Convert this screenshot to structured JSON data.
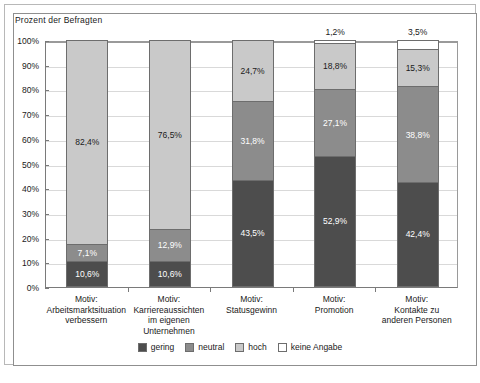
{
  "chart_data": {
    "type": "bar",
    "subtype": "stacked-percentage",
    "title": "Prozent der Befragten",
    "xlabel": "",
    "ylabel": "Prozent der Befragten",
    "ylim": [
      0,
      100
    ],
    "ytick_labels": [
      "100%",
      "90%",
      "80%",
      "70%",
      "60%",
      "50%",
      "40%",
      "30%",
      "20%",
      "10%",
      "0%"
    ],
    "ytick_values": [
      100,
      90,
      80,
      70,
      60,
      50,
      40,
      30,
      20,
      10,
      0
    ],
    "grid": true,
    "legend_position": "bottom",
    "categories": [
      [
        "Motiv:",
        "Arbeitsmarktsituation",
        "verbessern"
      ],
      [
        "Motiv:",
        "Karriereaussichten",
        "im eigenen",
        "Unternehmen"
      ],
      [
        "Motiv:",
        "Statusgewinn"
      ],
      [
        "Motiv:",
        "Promotion"
      ],
      [
        "Motiv:",
        "Kontakte zu",
        "anderen Personen"
      ]
    ],
    "series": [
      {
        "name": "gering",
        "color": "#4d4d4d",
        "values": [
          10.6,
          10.6,
          43.5,
          52.9,
          42.4
        ],
        "labels": [
          "10,6%",
          "10,6%",
          "43,5%",
          "52,9%",
          "42,4%"
        ]
      },
      {
        "name": "neutral",
        "color": "#8c8c8c",
        "values": [
          7.1,
          12.9,
          31.8,
          27.1,
          38.8
        ],
        "labels": [
          "7,1%",
          "12,9%",
          "31,8%",
          "27,1%",
          "38,8%"
        ]
      },
      {
        "name": "hoch",
        "color": "#c9c9c9",
        "values": [
          82.4,
          76.5,
          24.7,
          18.8,
          15.3
        ],
        "labels": [
          "82,4%",
          "76,5%",
          "24,7%",
          "18,8%",
          "15,3%"
        ]
      },
      {
        "name": "keine Angabe",
        "color": "#ffffff",
        "values": [
          0,
          0,
          0,
          1.2,
          3.5
        ],
        "labels": [
          "",
          "",
          "",
          "1,2%",
          "3,5%"
        ]
      }
    ]
  },
  "legend": {
    "items": [
      {
        "label": "gering",
        "color": "#4d4d4d"
      },
      {
        "label": "neutral",
        "color": "#8c8c8c"
      },
      {
        "label": "hoch",
        "color": "#c9c9c9"
      },
      {
        "label": "keine Angabe",
        "color": "#ffffff"
      }
    ]
  },
  "caption": {
    "text": ""
  }
}
